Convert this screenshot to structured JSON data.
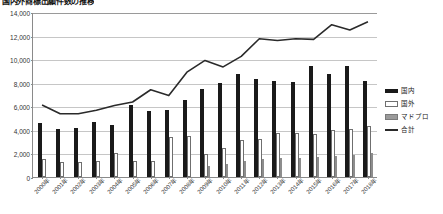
{
  "chart_data": {
    "type": "bar",
    "title": "国内外商標出願件数の推移",
    "xlabel": "",
    "ylabel": "",
    "ylim": [
      0,
      14000
    ],
    "ytick_step": 2000,
    "ytick_labels": [
      "0",
      "2,000",
      "4,000",
      "6,000",
      "8,000",
      "10,000",
      "12,000",
      "14,000"
    ],
    "grid": true,
    "legend_position": "right",
    "categories": [
      "2000年",
      "2001年",
      "2002年",
      "2003年",
      "2004年",
      "2005年",
      "2006年",
      "2007年",
      "2008年",
      "2009年",
      "2010年",
      "2011年",
      "2012年",
      "2013年",
      "2014年",
      "2015年",
      "2016年",
      "2017年",
      "2018年"
    ],
    "series": [
      {
        "name": "国内",
        "type": "bar",
        "color": "#1a1a1a",
        "values": [
          4600,
          4100,
          4150,
          4650,
          4400,
          6100,
          5600,
          5650,
          6500,
          7500,
          7950,
          8750,
          8300,
          8150,
          8100,
          9450,
          8750,
          9400,
          8150
        ]
      },
      {
        "name": "国外",
        "type": "bar",
        "color": "#ffffff",
        "values": [
          1500,
          1300,
          1250,
          1400,
          2000,
          1350,
          1400,
          3400,
          3500,
          1950,
          2450,
          3100,
          3250,
          3750,
          3750,
          3650,
          3950,
          4050,
          4300
        ]
      },
      {
        "name": "マドプロ",
        "type": "bar",
        "color": "#8d8d8d",
        "values": [
          0,
          0,
          0,
          0,
          0,
          0,
          0,
          0,
          0,
          900,
          1100,
          1400,
          1500,
          1600,
          1650,
          1700,
          1800,
          1900,
          2000
        ]
      },
      {
        "name": "合計",
        "type": "line",
        "color": "#2a2a2a",
        "values": [
          6150,
          5400,
          5400,
          5700,
          6100,
          6400,
          7450,
          6950,
          8950,
          9950,
          9400,
          10300,
          11800,
          11650,
          11800,
          11750,
          13000,
          12550,
          13250
        ]
      }
    ]
  },
  "legend": {
    "items": [
      {
        "label": "国内",
        "swatch": "bar-black-swatch"
      },
      {
        "label": "国外",
        "swatch": "bar-white-swatch"
      },
      {
        "label": "マドプロ",
        "swatch": "bar-gray-swatch"
      },
      {
        "label": "合計",
        "swatch": "line-swatch"
      }
    ]
  }
}
